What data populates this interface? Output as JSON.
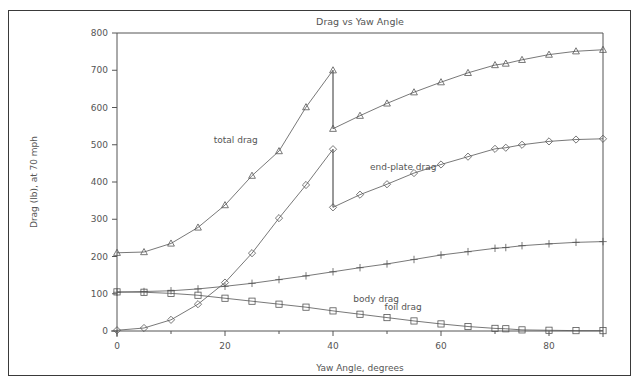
{
  "frame": {
    "border_color": "#3a3a3a",
    "background": "#ffffff"
  },
  "chart_data": {
    "type": "line",
    "title": "Drag vs Yaw Angle",
    "xlabel": "Yaw Angle, degrees",
    "ylabel": "Drag (lb), at 70 mph",
    "xlim": [
      0,
      90
    ],
    "ylim": [
      0,
      800
    ],
    "xticks": [
      0,
      20,
      40,
      60,
      80
    ],
    "xtick_labels": [
      "0",
      "20",
      "40",
      "60",
      "80"
    ],
    "xminorticks": [
      10,
      30,
      50,
      70
    ],
    "yticks": [
      0,
      100,
      200,
      300,
      400,
      500,
      600,
      700,
      800
    ],
    "ytick_labels": [
      "0",
      "100",
      "200",
      "300",
      "400",
      "500",
      "600",
      "700",
      "800"
    ],
    "grid": false,
    "legend_position": "inline-annotations",
    "line_color": "#555555",
    "x": [
      0,
      5,
      10,
      15,
      20,
      25,
      30,
      35,
      40,
      45,
      50,
      55,
      60,
      65,
      70,
      72,
      75,
      80,
      85,
      90
    ],
    "series": [
      {
        "name": "total drag",
        "marker": "triangle",
        "label_x": 22,
        "label_y": 505,
        "discontinuity_at_x": 40,
        "values_lower_branch": [
          210,
          212,
          235,
          278,
          338,
          417,
          483,
          601,
          700
        ],
        "values": [
          210,
          212,
          235,
          278,
          338,
          417,
          483,
          601,
          700,
          578,
          611,
          641,
          668,
          693,
          714,
          718,
          728,
          742,
          751,
          755
        ],
        "values_after_jump": [
          543,
          578,
          611,
          641,
          668,
          693,
          714,
          718,
          728,
          742,
          751,
          755
        ],
        "jump_from": 700,
        "jump_to": 543
      },
      {
        "name": "end-plate drag",
        "marker": "diamond",
        "label_x": 53,
        "label_y": 432,
        "discontinuity_at_x": 40,
        "values": [
          2,
          8,
          30,
          72,
          130,
          209,
          303,
          392,
          488,
          366,
          394,
          424,
          447,
          468,
          489,
          492,
          500,
          509,
          514,
          516
        ],
        "values_after_jump": [
          332,
          366,
          394,
          424,
          447,
          468,
          489,
          492,
          500,
          509,
          514,
          516
        ],
        "jump_from": 488,
        "jump_to": 332
      },
      {
        "name": "body drag",
        "marker": "plus",
        "label_x": 48,
        "label_y": 78,
        "values": [
          104,
          106,
          108,
          113,
          120,
          128,
          138,
          148,
          159,
          170,
          180,
          192,
          204,
          213,
          222,
          224,
          229,
          234,
          238,
          240
        ]
      },
      {
        "name": "foil drag",
        "marker": "square",
        "label_x": 53,
        "label_y": 56,
        "values": [
          105,
          104,
          101,
          96,
          88,
          80,
          72,
          64,
          54,
          45,
          36,
          27,
          19,
          12,
          7,
          6,
          3,
          2,
          1,
          1
        ]
      }
    ]
  }
}
